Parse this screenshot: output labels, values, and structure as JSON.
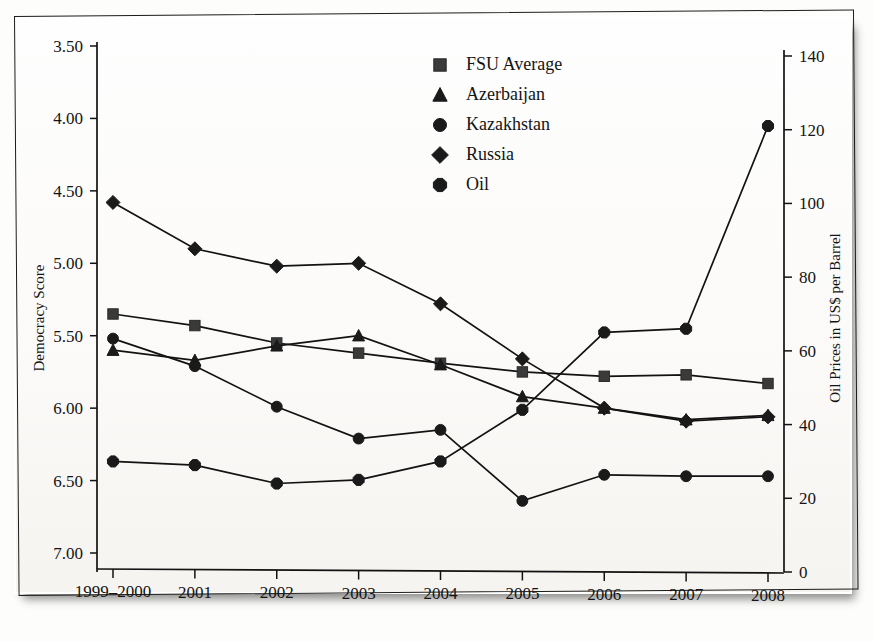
{
  "figure": {
    "left_axis_title": "Democracy Score",
    "right_axis_title": "Oil Prices in US$ per Barrel"
  },
  "legend": {
    "position": "top-center",
    "items": [
      {
        "label": "FSU Average",
        "marker": "square-marker"
      },
      {
        "label": "Azerbaijan",
        "marker": "triangle-marker"
      },
      {
        "label": "Kazakhstan",
        "marker": "circle-marker"
      },
      {
        "label": "Russia",
        "marker": "diamond-marker"
      },
      {
        "label": "Oil",
        "marker": "hexagon-marker"
      }
    ]
  },
  "left_axis": {
    "label": "Democracy Score",
    "ticks": [
      "3.50",
      "4.00",
      "4.50",
      "5.00",
      "5.50",
      "6.00",
      "6.50",
      "7.00"
    ],
    "values": [
      3.5,
      4.0,
      4.5,
      5.0,
      5.5,
      6.0,
      6.5,
      7.0
    ],
    "inverted": true
  },
  "right_axis": {
    "label": "Oil Prices in US$ per Barrel",
    "ticks": [
      "140",
      "120",
      "100",
      "80",
      "60",
      "40",
      "20",
      "0"
    ],
    "values": [
      140,
      120,
      100,
      80,
      60,
      40,
      20,
      0
    ]
  },
  "x_axis": {
    "ticks": [
      "1999–2000",
      "2001",
      "2002",
      "2003",
      "2004",
      "2005",
      "2006",
      "2007",
      "2008"
    ]
  },
  "chart_data": {
    "type": "line",
    "title": "",
    "xlabel": "",
    "ylabel": "Democracy Score",
    "y2label": "Oil Prices in US$ per Barrel",
    "categories": [
      "1999–2000",
      "2001",
      "2002",
      "2003",
      "2004",
      "2005",
      "2006",
      "2007",
      "2008"
    ],
    "ylim": [
      3.5,
      7.0
    ],
    "y_inverted": true,
    "y2lim": [
      0,
      140
    ],
    "grid": false,
    "legend_position": "top-center",
    "series": [
      {
        "name": "FSU Average",
        "marker": "square",
        "axis": "left",
        "values": [
          5.35,
          5.43,
          5.55,
          5.62,
          5.69,
          5.75,
          5.78,
          5.77,
          5.83
        ]
      },
      {
        "name": "Azerbaijan",
        "marker": "triangle",
        "axis": "left",
        "values": [
          5.6,
          5.67,
          5.57,
          5.5,
          5.7,
          5.92,
          6.0,
          6.08,
          6.05
        ]
      },
      {
        "name": "Kazakhstan",
        "marker": "circle",
        "axis": "left",
        "values": [
          5.52,
          5.71,
          5.99,
          6.21,
          6.15,
          6.64,
          6.46,
          6.47,
          6.47
        ]
      },
      {
        "name": "Russia",
        "marker": "diamond",
        "axis": "left",
        "values": [
          4.58,
          4.9,
          5.02,
          5.0,
          5.28,
          5.66,
          6.0,
          6.09,
          6.06
        ]
      },
      {
        "name": "Oil",
        "marker": "hexagon",
        "axis": "right",
        "values": [
          30,
          29,
          24,
          25,
          30,
          44,
          65,
          66,
          121
        ]
      }
    ]
  }
}
